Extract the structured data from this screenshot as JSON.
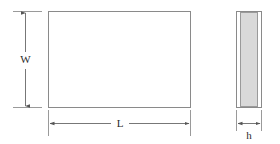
{
  "figure": {
    "type": "engineering-dimension-drawing",
    "background_color": "#ffffff",
    "line_color": "#808080",
    "text_color": "#2b2b2b",
    "shading_color": "#d8d8d8"
  },
  "views": {
    "front": {
      "name": "front-view",
      "shape": "rectangle",
      "fill": "none",
      "x": 48,
      "y": 11,
      "width": 143,
      "height": 97
    },
    "side": {
      "name": "side-view",
      "shape": "rectangle",
      "outer_fill": "none",
      "inner_fill": "#d8d8d8",
      "x": 236,
      "y": 11,
      "width": 26,
      "height": 97,
      "inner_inset": 4
    }
  },
  "dimensions": [
    {
      "id": "width",
      "label": "W",
      "orientation": "vertical",
      "label_x": 25,
      "label_y": 60,
      "line_x": 25,
      "line_top": 12,
      "line_bottom": 107,
      "ext_top_y": 11,
      "ext_bottom_y": 108,
      "ext_x1": 13,
      "ext_x2": 42,
      "gap_half": 9
    },
    {
      "id": "length",
      "label": "L",
      "orientation": "horizontal",
      "label_x": 120,
      "label_y": 124,
      "line_y": 124,
      "line_left": 49,
      "line_right": 190,
      "ext_left_x": 48,
      "ext_right_x": 191,
      "ext_y1": 110,
      "ext_y2": 136,
      "gap_half": 9
    },
    {
      "id": "height",
      "label": "h",
      "orientation": "horizontal",
      "label_x": 249,
      "label_y": 135,
      "line_y": 124,
      "line_left": 237,
      "line_right": 261,
      "ext_left_x": 236,
      "ext_right_x": 262,
      "ext_y1": 110,
      "ext_y2": 131,
      "gap_half": 0
    }
  ],
  "labels": {
    "width": "W",
    "length": "L",
    "height": "h"
  }
}
